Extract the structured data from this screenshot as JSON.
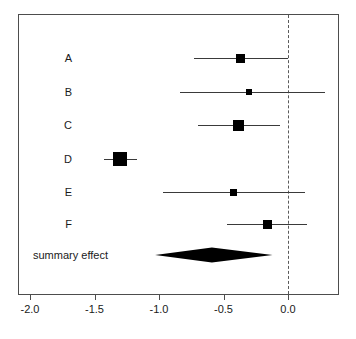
{
  "chart_data": {
    "type": "forest",
    "title": "",
    "xlabel": "",
    "ylabel": "",
    "xlim": [
      -2.2,
      0.4
    ],
    "grid": false,
    "null_value": 0.0,
    "axis_ticks": [
      {
        "value": -2.0,
        "label": "-2.0"
      },
      {
        "value": -1.5,
        "label": "-1.5"
      },
      {
        "value": -1.0,
        "label": "-1.0"
      },
      {
        "value": -0.5,
        "label": "-0.5"
      },
      {
        "value": 0.0,
        "label": "0.0"
      }
    ],
    "studies": [
      {
        "label": "A",
        "estimate": -0.37,
        "ci_low": -0.73,
        "ci_high": 0.0,
        "marker_size": 9
      },
      {
        "label": "B",
        "estimate": -0.3,
        "ci_low": -0.84,
        "ci_high": 0.29,
        "marker_size": 6
      },
      {
        "label": "C",
        "estimate": -0.38,
        "ci_low": -0.7,
        "ci_high": -0.06,
        "marker_size": 11
      },
      {
        "label": "D",
        "estimate": -1.3,
        "ci_low": -1.43,
        "ci_high": -1.17,
        "marker_size": 14
      },
      {
        "label": "E",
        "estimate": -0.42,
        "ci_low": -0.97,
        "ci_high": 0.13,
        "marker_size": 7
      },
      {
        "label": "F",
        "estimate": -0.16,
        "ci_low": -0.47,
        "ci_high": 0.15,
        "marker_size": 9
      }
    ],
    "summary": {
      "label": "summary effect",
      "estimate": -0.59,
      "ci_low": -1.03,
      "ci_high": -0.12
    },
    "colors": {
      "marker": "#000000",
      "line": "#3a3a3a",
      "frame": "#4d4d4d",
      "null_line": "#5a5a5a",
      "text": "#1a1a1a",
      "background": "#ffffff"
    }
  }
}
